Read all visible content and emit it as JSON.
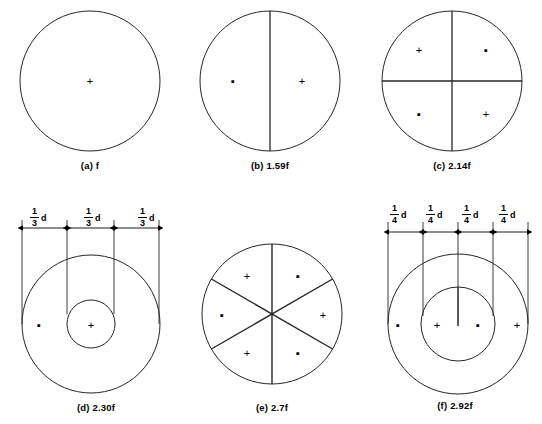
{
  "figure": {
    "background": "#ffffff",
    "stroke_color": "#262626",
    "marker_cross": "+",
    "marker_dot": "▪"
  },
  "panels": [
    {
      "id": "a",
      "caption_label": "(a)",
      "caption_value": "f",
      "type": "single-circle",
      "divisions": 1,
      "markers": [
        {
          "symbol": "+",
          "x": 50,
          "y": 50
        }
      ]
    },
    {
      "id": "b",
      "caption_label": "(b)",
      "caption_value": "1.59f",
      "type": "circle-halved-vertical",
      "divisions": 2,
      "markers": [
        {
          "symbol": "▪",
          "x": 27,
          "y": 50
        },
        {
          "symbol": "+",
          "x": 70,
          "y": 50
        }
      ]
    },
    {
      "id": "c",
      "caption_label": "(c)",
      "caption_value": "2.14f",
      "type": "circle-quartered",
      "divisions": 4,
      "markers": [
        {
          "symbol": "+",
          "x": 29,
          "y": 28
        },
        {
          "symbol": "▪",
          "x": 71,
          "y": 28
        },
        {
          "symbol": "▪",
          "x": 29,
          "y": 72
        },
        {
          "symbol": "+",
          "x": 71,
          "y": 72
        }
      ]
    },
    {
      "id": "d",
      "caption_label": "(d)",
      "caption_value": "2.30f",
      "type": "concentric-two",
      "divisions": 3,
      "dimensions": [
        {
          "numerator": "1",
          "denominator": "3",
          "unit": "d"
        },
        {
          "numerator": "1",
          "denominator": "3",
          "unit": "d"
        },
        {
          "numerator": "1",
          "denominator": "3",
          "unit": "d"
        }
      ],
      "markers": [
        {
          "symbol": "▪",
          "x": 22,
          "y": 57
        },
        {
          "symbol": "+",
          "x": 50,
          "y": 57
        }
      ]
    },
    {
      "id": "e",
      "caption_label": "(e)",
      "caption_value": "2.7f",
      "type": "circle-six-sectors",
      "divisions": 6,
      "markers": [
        {
          "symbol": "+",
          "x": 34,
          "y": 25
        },
        {
          "symbol": "▪",
          "x": 66,
          "y": 25
        },
        {
          "symbol": "▪",
          "x": 18,
          "y": 52
        },
        {
          "symbol": "+",
          "x": 82,
          "y": 52
        },
        {
          "symbol": "+",
          "x": 34,
          "y": 78
        },
        {
          "symbol": "▪",
          "x": 66,
          "y": 78
        }
      ]
    },
    {
      "id": "f",
      "caption_label": "(f)",
      "caption_value": "2.92f",
      "type": "concentric-two-split",
      "divisions": 4,
      "dimensions": [
        {
          "numerator": "1",
          "denominator": "4",
          "unit": "d"
        },
        {
          "numerator": "1",
          "denominator": "4",
          "unit": "d"
        },
        {
          "numerator": "1",
          "denominator": "4",
          "unit": "d"
        },
        {
          "numerator": "1",
          "denominator": "4",
          "unit": "d"
        }
      ],
      "markers": [
        {
          "symbol": "▪",
          "x": 17,
          "y": 57
        },
        {
          "symbol": "+",
          "x": 39,
          "y": 57
        },
        {
          "symbol": "▪",
          "x": 61,
          "y": 57
        },
        {
          "symbol": "+",
          "x": 84,
          "y": 57
        }
      ]
    }
  ]
}
